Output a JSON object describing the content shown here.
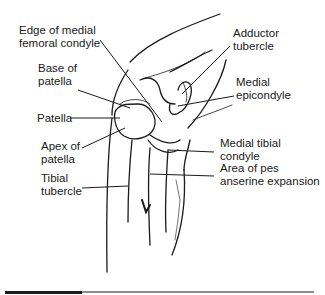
{
  "diagram": {
    "labels": {
      "edge_medial_femoral_condyle": "Edge of medial\nfemoral condyle",
      "base_of_patella": "Base of\npatella",
      "patella": "Patella",
      "apex_of_patella": "Apex of\npatella",
      "tibial_tubercle": "Tibial\ntubercle",
      "adductor_tubercle": "Adductor\ntubercle",
      "medial_epicondyle": "Medial\nepicondyle",
      "medial_tibial_condyle": "Medial tibial\ncondyle",
      "pes_anserine": "Area of pes\nanserine expansion"
    },
    "colors": {
      "line": "#1a1a1a",
      "background": "#ffffff"
    }
  }
}
